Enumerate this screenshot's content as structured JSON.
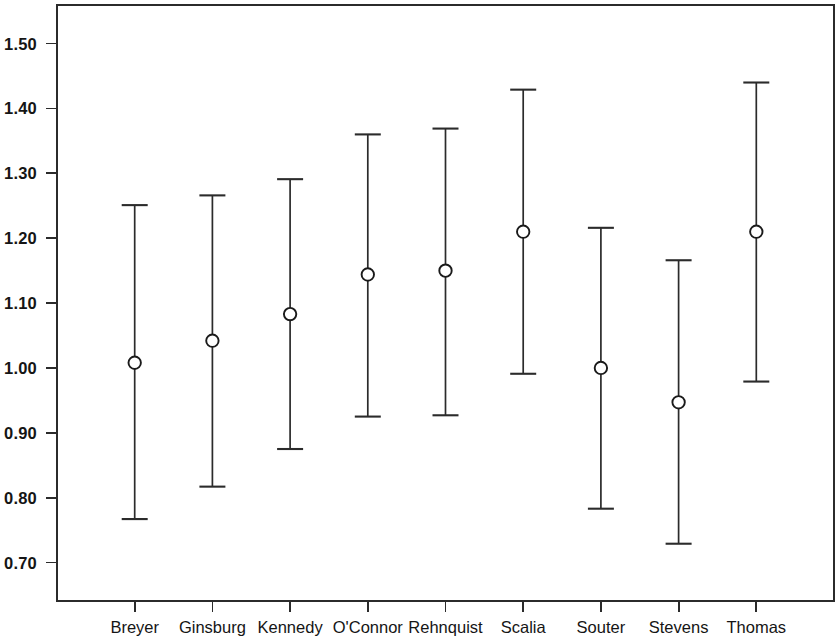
{
  "chart_data": {
    "type": "scatter",
    "title": "",
    "subtitle": "",
    "xlabel": "",
    "ylabel": "",
    "grid": false,
    "legend": "none",
    "categories": [
      "Breyer",
      "Ginsburg",
      "Kennedy",
      "O'Connor",
      "Rehnquist",
      "Scalia",
      "Souter",
      "Stevens",
      "Thomas"
    ],
    "values": [
      1.008,
      1.042,
      1.083,
      1.144,
      1.15,
      1.21,
      1.0,
      0.947,
      1.21
    ],
    "error_low": [
      0.767,
      0.817,
      0.875,
      0.925,
      0.927,
      0.991,
      0.783,
      0.729,
      0.979
    ],
    "error_high": [
      1.251,
      1.266,
      1.291,
      1.36,
      1.369,
      1.429,
      1.216,
      1.166,
      1.44
    ],
    "series": [
      {
        "name": "estimate",
        "points": [
          {
            "category": "Breyer",
            "value": 1.008,
            "low": 0.767,
            "high": 1.251
          },
          {
            "category": "Ginsburg",
            "value": 1.042,
            "low": 0.817,
            "high": 1.266
          },
          {
            "category": "Kennedy",
            "value": 1.083,
            "low": 0.875,
            "high": 1.291
          },
          {
            "category": "O'Connor",
            "value": 1.144,
            "low": 0.925,
            "high": 1.36
          },
          {
            "category": "Rehnquist",
            "value": 1.15,
            "low": 0.927,
            "high": 1.369
          },
          {
            "category": "Scalia",
            "value": 1.21,
            "low": 0.991,
            "high": 1.429
          },
          {
            "category": "Souter",
            "value": 1.0,
            "low": 0.783,
            "high": 1.216
          },
          {
            "category": "Stevens",
            "value": 0.947,
            "low": 0.729,
            "high": 1.166
          },
          {
            "category": "Thomas",
            "value": 1.21,
            "low": 0.979,
            "high": 1.44
          }
        ]
      }
    ],
    "ylim": [
      0.6407,
      1.5595
    ],
    "yticks": [
      0.7,
      0.8,
      0.9,
      1.0,
      1.1,
      1.2,
      1.3,
      1.4,
      1.5
    ],
    "ytick_labels": [
      "0.70",
      "0.80",
      "0.90",
      "1.00",
      "1.10",
      "1.20",
      "1.30",
      "1.40",
      "1.50"
    ],
    "xlim": [
      0,
      10
    ],
    "marker": "open-circle",
    "colors": {
      "axis": "#2b2b2b",
      "marker_stroke": "#1a1a1a",
      "marker_fill": "#ffffff",
      "text": "#151515",
      "background": "#ffffff"
    }
  }
}
